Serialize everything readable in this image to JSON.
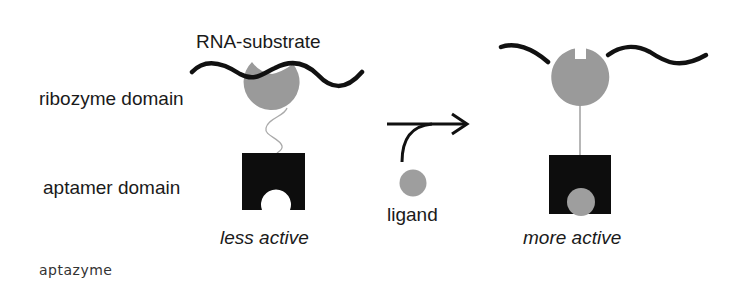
{
  "labels": {
    "rna_substrate": "RNA-substrate",
    "ribozyme_domain": "ribozyme domain",
    "aptamer_domain": "aptamer domain",
    "less_active": "less active",
    "ligand": "ligand",
    "more_active": "more active"
  },
  "caption": "aptazyme",
  "colors": {
    "strand": "#111111",
    "ribozyme": "#9a9a9a",
    "aptamer": "#0d0d0d",
    "ligand": "#9e9e9e",
    "linker": "#9a9a9a",
    "arrow": "#111111"
  },
  "states": [
    {
      "name": "inactive",
      "label": "less active",
      "ligand_bound": false
    },
    {
      "name": "active",
      "label": "more active",
      "ligand_bound": true
    }
  ]
}
